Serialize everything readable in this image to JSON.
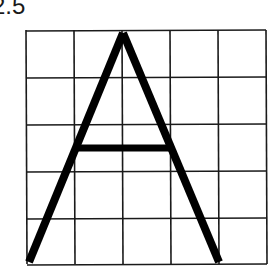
{
  "figure": {
    "label": "2.5",
    "grid": {
      "rows": 5,
      "cols": 5,
      "x_lines": [
        26,
        74,
        122,
        170,
        218,
        266
      ],
      "y_lines": [
        30,
        77,
        124,
        171,
        218,
        264
      ],
      "line_color": "#1a1a1a"
    },
    "letter": {
      "character": "A",
      "stroke_color": "#000000",
      "apex": [
        123,
        32
      ],
      "left_foot": [
        29,
        262
      ],
      "right_foot": [
        219,
        262
      ],
      "crossbar": {
        "x1": 76,
        "x2": 172,
        "y": 148
      }
    }
  }
}
